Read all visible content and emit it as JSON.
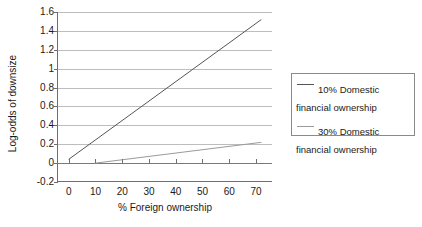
{
  "chart_data": {
    "type": "line",
    "title": "",
    "xlabel": "% Foreign ownership",
    "ylabel": "Log-odds of downsize",
    "xlim": [
      -4,
      76
    ],
    "ylim": [
      -0.2,
      1.6
    ],
    "grid": "horizontal",
    "legend_position": "right",
    "x_ticks": [
      0,
      10,
      20,
      30,
      40,
      50,
      60,
      70
    ],
    "x_tick_labels": [
      "0",
      "10",
      "20",
      "30",
      "40",
      "50",
      "60",
      "70"
    ],
    "y_ticks": [
      -0.2,
      0,
      0.2,
      0.4,
      0.6,
      0.8,
      1.0,
      1.2,
      1.4,
      1.6
    ],
    "y_tick_labels": [
      "-0.2",
      "0",
      "0.2",
      "0.4",
      "0.6",
      "0.8",
      "1",
      "1.2",
      "1.4",
      "1.6"
    ],
    "series": [
      {
        "name": "10%  Domestic\nfinancial ownership",
        "color": "#555555",
        "x": [
          0,
          72
        ],
        "values": [
          0.04,
          1.52
        ]
      },
      {
        "name": "30% Domestic\nfinancial ownership",
        "color": "#9a9a9a",
        "x": [
          10,
          72
        ],
        "values": [
          0.0,
          0.22
        ]
      }
    ]
  },
  "legend": {
    "items": [
      {
        "label": "10%  Domestic\nfinancial ownership"
      },
      {
        "label": "30% Domestic\nfinancial ownership"
      }
    ]
  },
  "axes": {
    "y_title": "Log-odds of downsize",
    "x_title": "% Foreign ownership"
  },
  "colors": {
    "series_1": "#555555",
    "series_2": "#9a9a9a",
    "gridline": "#bdbdbd",
    "axis": "#6f6f6f",
    "background": "#ffffff"
  }
}
